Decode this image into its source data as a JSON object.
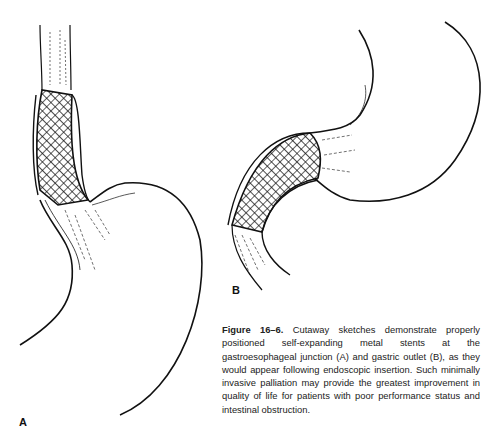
{
  "figure": {
    "panels": [
      {
        "label": "A",
        "subject": "gastroesophageal junction stent"
      },
      {
        "label": "B",
        "subject": "gastric outlet stent"
      }
    ],
    "caption": {
      "number": "Figure 16–6.",
      "text": "Cutaway sketches demonstrate properly positioned self-expanding metal stents at the gastroesophageal junction (A) and gastric outlet (B), as they would appear following endoscopic insertion. Such minimally invasive palliation may provide the greatest improvement in quality of life for patients with poor performance status and intestinal obstruction."
    },
    "colors": {
      "ink": "#111111",
      "background": "#ffffff"
    }
  }
}
